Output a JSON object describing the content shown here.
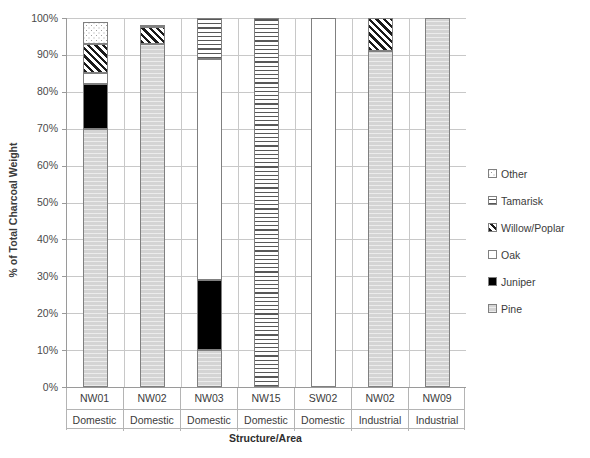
{
  "chart_data": {
    "type": "bar",
    "subtype": "stacked-100-percent",
    "title": "",
    "xlabel": "Structure/Area",
    "ylabel": "% of Total Charcoal Weight",
    "ylim": [
      0,
      100
    ],
    "ytick_labels": [
      "100%",
      "90%",
      "80%",
      "70%",
      "60%",
      "50%",
      "40%",
      "30%",
      "20%",
      "10%",
      "0%"
    ],
    "ytick_values": [
      100,
      90,
      80,
      70,
      60,
      50,
      40,
      30,
      20,
      10,
      0
    ],
    "grid": true,
    "legend_position": "right",
    "categories": [
      "NW01",
      "NW02",
      "NW03",
      "NW15",
      "SW02",
      "NW02",
      "NW09"
    ],
    "category_groups": [
      "Domestic",
      "Domestic",
      "Domestic",
      "Domestic",
      "Domestic",
      "Industrial",
      "Industrial"
    ],
    "series": [
      {
        "name": "Pine",
        "values": [
          70,
          93,
          10,
          0,
          0,
          91,
          100
        ]
      },
      {
        "name": "Juniper",
        "values": [
          12,
          0,
          19,
          0,
          0,
          0,
          0
        ]
      },
      {
        "name": "Oak",
        "values": [
          3,
          0,
          60,
          0,
          100,
          0,
          0
        ]
      },
      {
        "name": "Willow/Poplar",
        "values": [
          8,
          4.5,
          0,
          0,
          0,
          9,
          0
        ]
      },
      {
        "name": "Tamarisk",
        "values": [
          0,
          0,
          11,
          100,
          0,
          0,
          0
        ]
      },
      {
        "name": "Other",
        "values": [
          6,
          0.5,
          0,
          0,
          0,
          0,
          0
        ]
      }
    ],
    "series_totals": [
      99,
      98,
      100,
      100,
      100,
      100,
      100
    ]
  },
  "axis": {
    "y_title": "% of Total Charcoal Weight",
    "x_title": "Structure/Area",
    "ticks": [
      {
        "label": "100%",
        "value": 100
      },
      {
        "label": "90%",
        "value": 90
      },
      {
        "label": "80%",
        "value": 80
      },
      {
        "label": "70%",
        "value": 70
      },
      {
        "label": "60%",
        "value": 60
      },
      {
        "label": "50%",
        "value": 50
      },
      {
        "label": "40%",
        "value": 40
      },
      {
        "label": "30%",
        "value": 30
      },
      {
        "label": "20%",
        "value": 20
      },
      {
        "label": "10%",
        "value": 10
      },
      {
        "label": "0%",
        "value": 0
      }
    ]
  },
  "x_axis_cells": [
    {
      "name": "NW01",
      "group": "Domestic"
    },
    {
      "name": "NW02",
      "group": "Domestic"
    },
    {
      "name": "NW03",
      "group": "Domestic"
    },
    {
      "name": "NW15",
      "group": "Domestic"
    },
    {
      "name": "SW02",
      "group": "Domestic"
    },
    {
      "name": "NW02",
      "group": "Industrial"
    },
    {
      "name": "NW09",
      "group": "Industrial"
    }
  ],
  "legend": {
    "items": [
      {
        "label": "Other",
        "key": "other",
        "swatch": "dotted-white",
        "color": "#ffffff"
      },
      {
        "label": "Tamarisk",
        "key": "tamarisk",
        "swatch": "horizontal-lines",
        "color": "#ffffff"
      },
      {
        "label": "Willow/Poplar",
        "key": "willow",
        "swatch": "diagonal-hatch",
        "color": "#ffffff"
      },
      {
        "label": "Oak",
        "key": "oak",
        "swatch": "solid-white",
        "color": "#ffffff"
      },
      {
        "label": "Juniper",
        "key": "juniper",
        "swatch": "solid-black",
        "color": "#000000"
      },
      {
        "label": "Pine",
        "key": "pine",
        "swatch": "light-gray",
        "color": "#d4d4d4"
      }
    ]
  },
  "bottom_caption": ""
}
